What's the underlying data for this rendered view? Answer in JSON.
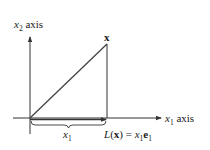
{
  "diagram": {
    "type": "projection-diagram",
    "axes": {
      "vertical_label": {
        "var": "x",
        "sub": "2",
        "suffix": " axis"
      },
      "horizontal_label": {
        "var": "x",
        "sub": "1",
        "suffix": " axis"
      }
    },
    "vector_label": "x",
    "brace_label": {
      "var": "x",
      "sub": "1"
    },
    "projection_label": {
      "func": "L",
      "open": "(",
      "arg": "x",
      "close": ")",
      "eq": " = ",
      "coef_var": "x",
      "coef_sub": "1",
      "basis": "e",
      "basis_sub": "1"
    },
    "colors": {
      "stroke": "#333333",
      "text": "#1a1a1a",
      "background": "#ffffff"
    }
  }
}
